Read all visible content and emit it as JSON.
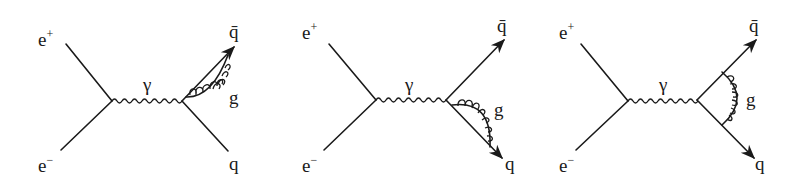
{
  "figure": {
    "diagrams": [
      {
        "id": "diagram-1",
        "gluon_placement": "self-energy on antiquark line",
        "labels": {
          "positron": "e",
          "positron_sup": "+",
          "electron": "e",
          "electron_sup": "−",
          "photon": "γ",
          "antiquark": "q̄",
          "gluon": "g",
          "quark": "q"
        }
      },
      {
        "id": "diagram-2",
        "gluon_placement": "self-energy on quark line",
        "labels": {
          "positron": "e",
          "positron_sup": "+",
          "electron": "e",
          "electron_sup": "−",
          "photon": "γ",
          "antiquark": "q̄",
          "gluon": "g",
          "quark": "q"
        }
      },
      {
        "id": "diagram-3",
        "gluon_placement": "vertex correction between quark and antiquark",
        "labels": {
          "positron": "e",
          "positron_sup": "+",
          "electron": "e",
          "electron_sup": "−",
          "photon": "γ",
          "antiquark": "q̄",
          "gluon": "g",
          "quark": "q"
        }
      }
    ],
    "colors": {
      "ink": "#1a1a1a",
      "background": "#ffffff"
    }
  }
}
